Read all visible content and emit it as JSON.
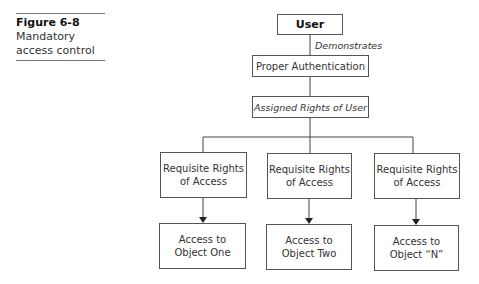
{
  "caption": {
    "figure_number": "Figure 6-8",
    "title_line1": "Mandatory",
    "title_line2": "access control"
  },
  "diagram": {
    "user": "User",
    "edge_label": "Demonstrates",
    "authentication": "Proper Authentication",
    "assigned_rights": "Assigned Rights of User",
    "branches": [
      {
        "requisite_line1": "Requisite Rights",
        "requisite_line2": "of Access",
        "object_line1": "Access to",
        "object_line2": "Object One"
      },
      {
        "requisite_line1": "Requisite Rights",
        "requisite_line2": "of Access",
        "object_line1": "Access to",
        "object_line2": "Object Two"
      },
      {
        "requisite_line1": "Requisite Rights",
        "requisite_line2": "of Access",
        "object_line1": "Access to",
        "object_line2": "Object “N”"
      }
    ]
  }
}
